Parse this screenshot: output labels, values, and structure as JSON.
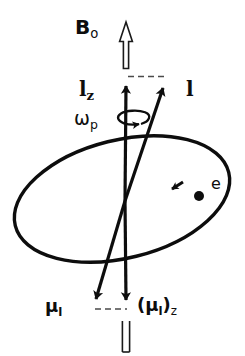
{
  "figure": {
    "background_color": "#ffffff",
    "ink_color": "#0d0d0d",
    "width": 245,
    "height": 356
  },
  "labels": {
    "magnetic_field": {
      "symbol": "B",
      "subscript": "o",
      "full": "Bₒ"
    },
    "l_z": {
      "symbol": "l",
      "subscript": "z",
      "full": "lᵩ"
    },
    "l": {
      "symbol": "l",
      "subscript": "",
      "full": "l"
    },
    "omega_p": {
      "symbol": "ω",
      "subscript": "p",
      "full": "ωₚ"
    },
    "electron": {
      "symbol": "e",
      "full": "e"
    },
    "mu_l": {
      "open": "",
      "symbol": "μ",
      "subscript": "l",
      "close": "",
      "full": "μₗ"
    },
    "mu_l_z": {
      "open": "(",
      "symbol": "μ",
      "subscript": "l",
      "close": ")",
      "subscript2": "z",
      "full": "(μₗ)ᵩ"
    }
  },
  "elements": {
    "b0_arrow": {
      "name": "hollow-up-arrow",
      "style": "outline",
      "direction": "up"
    },
    "b0_arrow_bottom": {
      "name": "hollow-shaft",
      "style": "outline",
      "direction": "down"
    },
    "lz_vector": {
      "name": "lz-vector",
      "style": "solid",
      "direction": "up"
    },
    "l_vector": {
      "name": "l-vector",
      "style": "solid",
      "direction": "up-right"
    },
    "mu_l_vector": {
      "name": "mu-l-vector",
      "style": "solid",
      "direction": "down-left"
    },
    "mu_l_z_vector": {
      "name": "mu-l-z-vector",
      "style": "solid",
      "direction": "down"
    },
    "orbit": {
      "name": "electron-orbit-ellipse",
      "style": "solid-ellipse"
    },
    "precession_loop": {
      "name": "precession-arrow-loop",
      "style": "curved-arrow"
    },
    "dashed_top": {
      "name": "dashed-projection-top",
      "style": "dashed"
    },
    "dashed_bottom": {
      "name": "dashed-projection-bottom",
      "style": "dashed"
    },
    "electron_dot": {
      "name": "electron-dot",
      "style": "filled-circle"
    },
    "orbit_direction_arrow": {
      "name": "orbit-direction-arrow",
      "style": "arrowhead"
    }
  },
  "geometry": {
    "origin": {
      "x": 125,
      "y": 201
    },
    "lz_tip": {
      "x": 126,
      "y": 78
    },
    "l_tip": {
      "x": 166,
      "y": 79
    },
    "mu_l_tip": {
      "x": 96,
      "y": 306
    },
    "mu_l_z_tip": {
      "x": 126,
      "y": 307
    },
    "orbit_center": {
      "x": 122,
      "y": 199
    },
    "orbit_rx": 110,
    "orbit_ry": 59,
    "orbit_rotation_deg": -14,
    "electron_dot_pos": {
      "x": 199,
      "y": 196
    }
  }
}
